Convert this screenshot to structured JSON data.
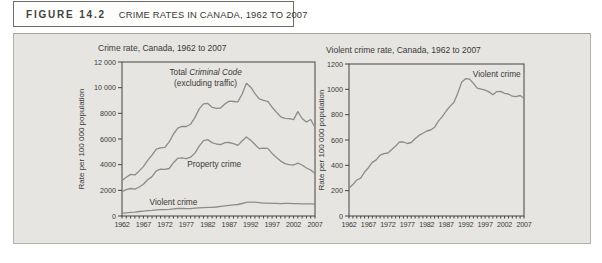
{
  "figure_header": {
    "label": "FIGURE 14.2",
    "title": "CRIME RATES IN CANADA, 1962 TO 2007"
  },
  "colors": {
    "panel_bg": "#e6e5e1",
    "line": "#8c8c8c",
    "axis": "#454545",
    "text": "#3b3a37"
  },
  "chart_data": [
    {
      "type": "line",
      "title": "Crime rate, Canada, 1962 to 2007",
      "xlabel": "",
      "ylabel": "Rate per 100 000 population",
      "xlim": [
        1962,
        2007
      ],
      "ylim": [
        0,
        12000
      ],
      "grid": false,
      "legend_position": "inline-annotations",
      "x_ticks": [
        1962,
        1967,
        1972,
        1977,
        1982,
        1987,
        1992,
        1997,
        2002,
        2007
      ],
      "y_ticks": [
        0,
        2000,
        4000,
        6000,
        8000,
        10000,
        12000
      ],
      "y_tick_labels": [
        "0",
        "2000",
        "4000",
        "6000",
        "8000",
        "10 000",
        "12 000"
      ],
      "x": [
        1962,
        1963,
        1964,
        1965,
        1966,
        1967,
        1968,
        1969,
        1970,
        1971,
        1972,
        1973,
        1974,
        1975,
        1976,
        1977,
        1978,
        1979,
        1980,
        1981,
        1982,
        1983,
        1984,
        1985,
        1986,
        1987,
        1988,
        1989,
        1990,
        1991,
        1992,
        1993,
        1994,
        1995,
        1996,
        1997,
        1998,
        1999,
        2000,
        2001,
        2002,
        2003,
        2004,
        2005,
        2006,
        2007
      ],
      "series": [
        {
          "name": "Total Criminal Code (excluding traffic)",
          "values": [
            2771,
            3022,
            3245,
            3199,
            3511,
            3850,
            4336,
            4737,
            5212,
            5311,
            5355,
            5773,
            6388,
            6852,
            6984,
            6971,
            7154,
            7666,
            8343,
            8736,
            8773,
            8470,
            8387,
            8413,
            8727,
            8957,
            8920,
            8892,
            9485,
            10342,
            10040,
            9538,
            9125,
            9008,
            8932,
            8475,
            8094,
            7733,
            7607,
            7587,
            7508,
            8132,
            7600,
            7325,
            7518,
            6899
          ]
        },
        {
          "name": "Property crime",
          "values": [
            1891,
            2047,
            2146,
            2091,
            2258,
            2467,
            2826,
            3067,
            3515,
            3649,
            3634,
            3704,
            4151,
            4498,
            4533,
            4466,
            4579,
            4903,
            5444,
            5873,
            5955,
            5717,
            5607,
            5560,
            5714,
            5731,
            5630,
            5503,
            5841,
            6160,
            5904,
            5575,
            5250,
            5292,
            5274,
            4880,
            4569,
            4276,
            4081,
            4004,
            3973,
            4121,
            3977,
            3738,
            3588,
            3320
          ]
        },
        {
          "name": "Violent crime",
          "values": [
            221,
            249,
            284,
            299,
            347,
            381,
            423,
            443,
            481,
            492,
            497,
            524,
            553,
            585,
            584,
            572,
            580,
            610,
            636,
            654,
            671,
            679,
            701,
            749,
            785,
            829,
            868,
            898,
            973,
            1059,
            1084,
            1081,
            1047,
            1009,
            1002,
            993,
            980,
            958,
            982,
            984,
            969,
            963,
            946,
            943,
            951,
            930
          ]
        }
      ],
      "annotations": [
        {
          "x": 1981.5,
          "y": 11150,
          "lines": [
            [
              {
                "t": "Total "
              },
              {
                "t": "Criminal Code",
                "i": true
              }
            ],
            [
              {
                "t": "(excluding traffic)"
              }
            ]
          ]
        },
        {
          "x": 1983.5,
          "y": 4050,
          "lines": [
            [
              {
                "t": "Property crime"
              }
            ]
          ]
        },
        {
          "x": 1974,
          "y": 1060,
          "lines": [
            [
              {
                "t": "Violent crime"
              }
            ]
          ]
        }
      ]
    },
    {
      "type": "line",
      "title": "Violent crime rate, Canada, 1962 to 2007",
      "xlabel": "",
      "ylabel": "Rate per 100 000 population",
      "xlim": [
        1962,
        2007
      ],
      "ylim": [
        0,
        1200
      ],
      "grid": false,
      "legend_position": "inline-annotations",
      "x_ticks": [
        1962,
        1967,
        1972,
        1977,
        1982,
        1987,
        1992,
        1997,
        2002,
        2007
      ],
      "y_ticks": [
        0,
        200,
        400,
        600,
        800,
        1000,
        1200
      ],
      "y_tick_labels": [
        "0",
        "200",
        "400",
        "600",
        "800",
        "1000",
        "1200"
      ],
      "x": [
        1962,
        1963,
        1964,
        1965,
        1966,
        1967,
        1968,
        1969,
        1970,
        1971,
        1972,
        1973,
        1974,
        1975,
        1976,
        1977,
        1978,
        1979,
        1980,
        1981,
        1982,
        1983,
        1984,
        1985,
        1986,
        1987,
        1988,
        1989,
        1990,
        1991,
        1992,
        1993,
        1994,
        1995,
        1996,
        1997,
        1998,
        1999,
        2000,
        2001,
        2002,
        2003,
        2004,
        2005,
        2006,
        2007
      ],
      "series": [
        {
          "name": "Violent crime",
          "values": [
            221,
            249,
            284,
            299,
            347,
            381,
            423,
            443,
            481,
            492,
            497,
            524,
            553,
            585,
            584,
            572,
            580,
            610,
            636,
            654,
            671,
            679,
            701,
            749,
            785,
            829,
            868,
            898,
            973,
            1059,
            1084,
            1081,
            1047,
            1009,
            1002,
            993,
            980,
            958,
            982,
            984,
            969,
            963,
            946,
            943,
            951,
            930
          ]
        }
      ],
      "annotations": [
        {
          "x": 2000,
          "y": 1120,
          "lines": [
            [
              {
                "t": "Violent crime"
              }
            ]
          ]
        }
      ]
    }
  ]
}
